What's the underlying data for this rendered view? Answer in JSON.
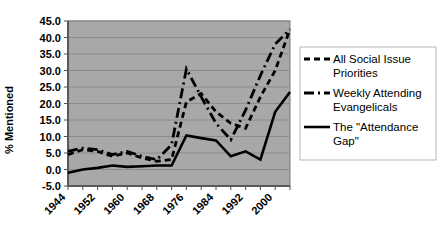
{
  "chart_data": {
    "type": "line",
    "title": "",
    "xlabel": "",
    "ylabel": "% Mentioned",
    "ylim": [
      -5.0,
      45.0
    ],
    "ytick_step": 5.0,
    "yticks": [
      "45.0",
      "40.0",
      "35.0",
      "30.0",
      "25.0",
      "20.0",
      "15.0",
      "10.0",
      "5.0",
      "0.0",
      "-5.0"
    ],
    "xlim": [
      1944,
      2004
    ],
    "xticks": [
      "1944",
      "1952",
      "1960",
      "1968",
      "1976",
      "1984",
      "1992",
      "2000"
    ],
    "x_tick_interval": 4,
    "x_all_points": [
      1944,
      1948,
      1952,
      1956,
      1960,
      1964,
      1968,
      1972,
      1976,
      1980,
      1984,
      1988,
      1992,
      1996,
      2000,
      2004
    ],
    "grid": true,
    "grid_orientation": "horizontal",
    "legend_position": "right",
    "plot_background": "#a8a8a8",
    "line_color": "#000000",
    "series": [
      {
        "name": "All Social Issue Priorities",
        "style": "dashed",
        "values": [
          4.5,
          6.0,
          5.5,
          4.0,
          5.0,
          3.5,
          2.5,
          3.0,
          20.5,
          23.0,
          17.5,
          14.0,
          12.5,
          22.0,
          30.0,
          42.5
        ]
      },
      {
        "name": "Weekly Attending Evangelicals",
        "style": "dash-dot",
        "values": [
          5.5,
          6.5,
          6.0,
          4.5,
          5.5,
          4.0,
          3.0,
          7.5,
          30.5,
          22.0,
          14.0,
          9.0,
          18.0,
          28.5,
          38.0,
          42.5
        ]
      },
      {
        "name": "The \"Attendance Gap\"",
        "style": "solid",
        "values": [
          -1.0,
          0.0,
          0.5,
          1.2,
          0.8,
          1.0,
          1.2,
          1.2,
          10.3,
          9.5,
          8.8,
          4.0,
          5.5,
          3.0,
          17.5,
          23.5
        ]
      }
    ]
  },
  "legend": {
    "items": [
      {
        "label": "All Social Issue Priorities",
        "style": "dashed"
      },
      {
        "label": "Weekly Attending Evangelicals",
        "style": "dash-dot"
      },
      {
        "label": "The \"Attendance Gap\"",
        "style": "solid"
      }
    ]
  }
}
